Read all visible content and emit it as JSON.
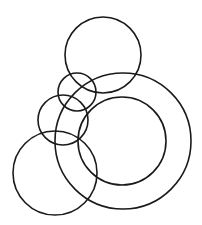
{
  "diagram": {
    "type": "overlapping-circles",
    "background": "#ffffff",
    "stroke_color": "#1a1a1a",
    "stroke_width": 1.6,
    "circles": [
      {
        "id": "top-circle",
        "cx": 103,
        "cy": 55,
        "r": 38
      },
      {
        "id": "outer-ring",
        "cx": 123,
        "cy": 141,
        "r": 68
      },
      {
        "id": "inner-ring",
        "cx": 122,
        "cy": 141,
        "r": 44
      },
      {
        "id": "small-upper-circle",
        "cx": 77,
        "cy": 92,
        "r": 19
      },
      {
        "id": "middle-left-circle",
        "cx": 63,
        "cy": 120,
        "r": 25
      },
      {
        "id": "bottom-left-circle",
        "cx": 55,
        "cy": 173,
        "r": 42
      }
    ]
  }
}
